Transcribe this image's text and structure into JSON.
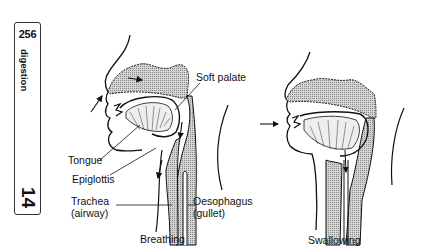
{
  "side_tab": {
    "page_number": "256",
    "chapter_name": "digestion",
    "chapter_number": "14"
  },
  "diagrams": [
    {
      "caption": "Breathing",
      "labels": {
        "soft_palate": "Soft palate",
        "tongue": "Tongue",
        "epiglottis": "Epiglottis",
        "trachea": "Trachea",
        "trachea_sub": "(airway)",
        "oesophagus": "Oesophagus",
        "oesophagus_sub": "(gullet)"
      }
    },
    {
      "caption": "Swallowing"
    }
  ],
  "colors": {
    "ink": "#111111",
    "shading": "#9a9a9a"
  }
}
